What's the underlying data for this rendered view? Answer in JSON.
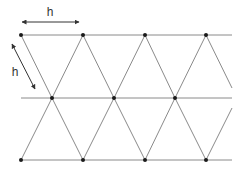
{
  "diagram": {
    "labels": {
      "horizontal_dimension": "h",
      "diagonal_dimension": "h"
    },
    "colors": {
      "line": "#8a8a8a",
      "node": "#1a1a1a",
      "arrow": "#333333",
      "text": "#333333"
    },
    "rows": [
      {
        "y": 35,
        "line_x1": 21,
        "line_x2": 232,
        "nodes_x": [
          21,
          83,
          145,
          206
        ]
      },
      {
        "y": 98,
        "line_x1": 21,
        "line_x2": 232,
        "nodes_x": [
          52,
          114,
          175
        ]
      },
      {
        "y": 160,
        "line_x1": 21,
        "line_x2": 232,
        "nodes_x": [
          21,
          83,
          145,
          206
        ]
      }
    ],
    "diagonals": [
      [
        21,
        35,
        52,
        98
      ],
      [
        52,
        98,
        83,
        160
      ],
      [
        83,
        35,
        52,
        98
      ],
      [
        52,
        98,
        21,
        160
      ],
      [
        83,
        35,
        114,
        98
      ],
      [
        114,
        98,
        145,
        160
      ],
      [
        145,
        35,
        114,
        98
      ],
      [
        114,
        98,
        83,
        160
      ],
      [
        145,
        35,
        175,
        98
      ],
      [
        175,
        98,
        206,
        160
      ],
      [
        206,
        35,
        175,
        98
      ],
      [
        175,
        98,
        145,
        160
      ],
      [
        206,
        35,
        232,
        88
      ],
      [
        232,
        108,
        206,
        160
      ]
    ]
  }
}
